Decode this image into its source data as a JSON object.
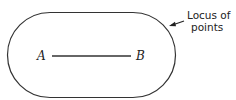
{
  "diagram": {
    "points": [
      {
        "label": "A"
      },
      {
        "label": "B"
      }
    ],
    "annotation": {
      "line1": "Locus of",
      "line2": "points"
    },
    "colors": {
      "stroke": "#333333",
      "background": "#ffffff"
    }
  }
}
